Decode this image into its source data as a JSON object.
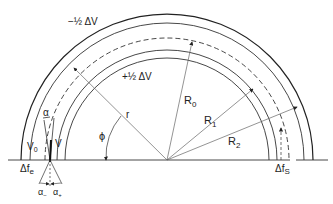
{
  "diagram": {
    "labels": {
      "minus_half_dv": "−½ ΔV",
      "plus_half_dv": "+½ ΔV",
      "r": "r",
      "phi": "ϕ",
      "R0": "R",
      "R0_sub": "0",
      "R1": "R",
      "R1_sub": "1",
      "R2": "R",
      "R2_sub": "2",
      "alpha": "α",
      "V0": "V",
      "V0_sub": "0",
      "V": "V",
      "dfe": "Δf",
      "dfe_sub": "e",
      "dfs": "Δf",
      "dfs_sub": "S",
      "alpha_minus": "α",
      "alpha_minus_sub": "−",
      "alpha_plus": "α",
      "alpha_plus_sub": "+"
    },
    "colors": {
      "line": "#222222",
      "thin": "#555555",
      "background": "#ffffff"
    }
  }
}
